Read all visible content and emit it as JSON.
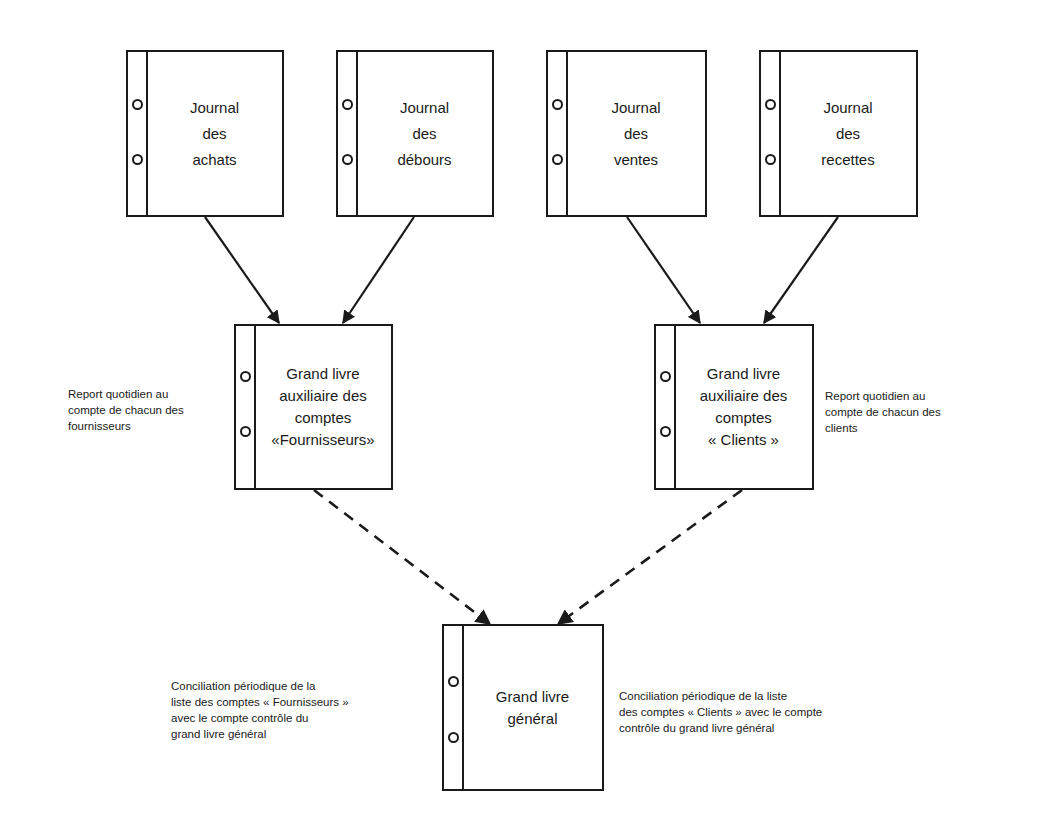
{
  "journals": [
    {
      "id": "achats",
      "lines": [
        "Journal",
        "des",
        "achats"
      ]
    },
    {
      "id": "debours",
      "lines": [
        "Journal",
        "des",
        "débours"
      ]
    },
    {
      "id": "ventes",
      "lines": [
        "Journal",
        "des",
        "ventes"
      ]
    },
    {
      "id": "recettes",
      "lines": [
        "Journal",
        "des",
        "recettes"
      ]
    }
  ],
  "subledgers": [
    {
      "id": "fournisseurs",
      "lines": [
        "Grand livre",
        "auxiliaire des",
        "comptes",
        "«Fournisseurs»"
      ]
    },
    {
      "id": "clients",
      "lines": [
        "Grand livre",
        "auxiliaire des",
        "comptes",
        "« Clients »"
      ]
    }
  ],
  "general_ledger": {
    "lines": [
      "Grand livre",
      "général"
    ]
  },
  "notes": {
    "posting_suppliers": [
      "Report quotidien au",
      "compte de chacun des",
      "fournisseurs"
    ],
    "posting_clients": [
      "Report quotidien au",
      "compte de chacun des",
      "clients"
    ],
    "reconciliation_suppliers": [
      "Conciliation périodique de la",
      "liste des comptes « Fournisseurs »",
      "avec le compte contrôle du",
      "grand livre général"
    ],
    "reconciliation_clients": [
      "Conciliation périodique de la liste",
      "des comptes « Clients » avec le compte",
      "contrôle du grand livre général"
    ]
  },
  "connections": [
    {
      "from": "Journal des achats",
      "to": "Grand livre auxiliaire des comptes «Fournisseurs»",
      "style": "solid"
    },
    {
      "from": "Journal des débours",
      "to": "Grand livre auxiliaire des comptes «Fournisseurs»",
      "style": "solid"
    },
    {
      "from": "Journal des ventes",
      "to": "Grand livre auxiliaire des comptes « Clients »",
      "style": "solid"
    },
    {
      "from": "Journal des recettes",
      "to": "Grand livre auxiliaire des comptes « Clients »",
      "style": "solid"
    },
    {
      "from": "Grand livre auxiliaire des comptes «Fournisseurs»",
      "to": "Grand livre général",
      "style": "dashed"
    },
    {
      "from": "Grand livre auxiliaire des comptes « Clients »",
      "to": "Grand livre général",
      "style": "dashed"
    }
  ]
}
